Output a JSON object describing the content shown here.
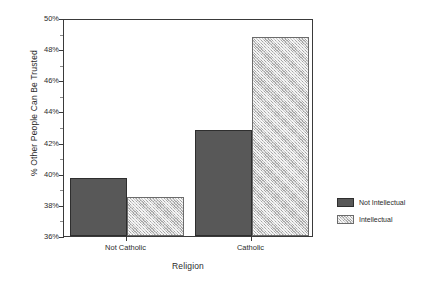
{
  "chart_data": {
    "type": "bar",
    "title": "",
    "subtitle": "",
    "xlabel": "Religion",
    "ylabel": "% Other People Can Be Trusted",
    "categories": [
      "Not Catholic",
      "Catholic"
    ],
    "series": [
      {
        "name": "Not Intellectual",
        "values": [
          39.7,
          42.8
        ],
        "color": "#585858"
      },
      {
        "name": "Intellectual",
        "values": [
          38.5,
          48.8
        ],
        "color": "#c9c9c9"
      }
    ],
    "ylim": [
      36,
      50
    ],
    "ytick_step": 2,
    "ytick_labels": [
      "50%",
      "48%",
      "46%",
      "44%",
      "42%",
      "40%",
      "38%",
      "36%"
    ],
    "ytick_values": [
      50,
      48,
      46,
      44,
      42,
      40,
      38,
      36
    ],
    "yminor_values": [
      49,
      47,
      45,
      43,
      41,
      39,
      37
    ],
    "grid": false,
    "legend_position": "right-bottom-outside",
    "value_format": "percent"
  },
  "legend": {
    "entries": [
      {
        "label": "Not Intellectual",
        "swatch": "dark"
      },
      {
        "label": "Intellectual",
        "swatch": "light"
      }
    ]
  },
  "axes": {
    "x_title": "Religion",
    "y_title": "% Other People Can Be Trusted"
  }
}
